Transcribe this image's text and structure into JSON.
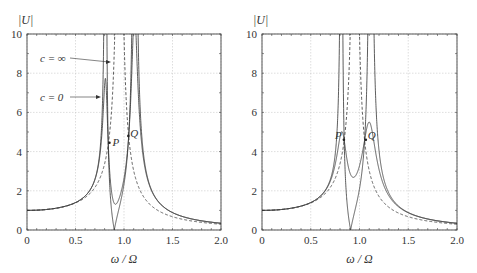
{
  "chart_data": [
    {
      "type": "line",
      "title": "",
      "xlabel": "ω / Ω",
      "ylabel": "|U|",
      "xlim": [
        0,
        2.0
      ],
      "ylim": [
        0,
        10
      ],
      "xticks": [
        "0",
        "0.5",
        "1.0",
        "1.5",
        "2.0"
      ],
      "yticks": [
        "0",
        "2",
        "4",
        "6",
        "8",
        "10"
      ],
      "grid": true,
      "model": {
        "mu": 0.1,
        "f": 0.9
      },
      "series": [
        {
          "name": "c = 0",
          "style": "solid",
          "description": "undamped absorber; peaks near 0.8 and 1.1, zero at 0.9"
        },
        {
          "name": "c = ∞",
          "style": "dashed",
          "description": "rigidly coupled mass; single resonance near 0.95"
        },
        {
          "name": "intermediate damping",
          "style": "solid",
          "description": "peak ~6.5 near 0.8, ~9 near 1.1, min ~1.6 at 0.9"
        }
      ],
      "annotations": [
        {
          "text": "c = ∞",
          "x": 0.35,
          "y": 8.6
        },
        {
          "text": "c = 0",
          "x": 0.35,
          "y": 6.5
        },
        {
          "text": "P",
          "x": 0.85,
          "y": 4.5
        },
        {
          "text": "Q",
          "x": 1.06,
          "y": 4.8
        }
      ]
    },
    {
      "type": "line",
      "title": "",
      "xlabel": "ω / Ω",
      "ylabel": "|U|",
      "xlim": [
        0,
        2.0
      ],
      "ylim": [
        0,
        10
      ],
      "xticks": [
        "0",
        "0.5",
        "1.0",
        "1.5",
        "2.0"
      ],
      "yticks": [
        "0",
        "2",
        "4",
        "6",
        "8",
        "10"
      ],
      "grid": true,
      "model": {
        "mu": 0.1,
        "f": 0.909
      },
      "series": [
        {
          "name": "c = 0",
          "style": "solid"
        },
        {
          "name": "c = ∞",
          "style": "dashed"
        },
        {
          "name": "optimal damping",
          "style": "solid",
          "description": "equal peaks ~4.6 at P (0.85) and Q (1.06), min ~3.7 near 0.93"
        }
      ],
      "annotations": [
        {
          "text": "P",
          "x": 0.82,
          "y": 4.6
        },
        {
          "text": "Q",
          "x": 1.08,
          "y": 4.6
        }
      ]
    }
  ],
  "plots": [
    {
      "ylabel": "|U|",
      "xlabel": "ω / Ω",
      "ann_cinf": "c = ∞",
      "ann_c0": "c = 0",
      "P": "P",
      "Q": "Q"
    },
    {
      "ylabel": "|U|",
      "xlabel": "ω / Ω",
      "P": "P",
      "Q": "Q"
    }
  ]
}
